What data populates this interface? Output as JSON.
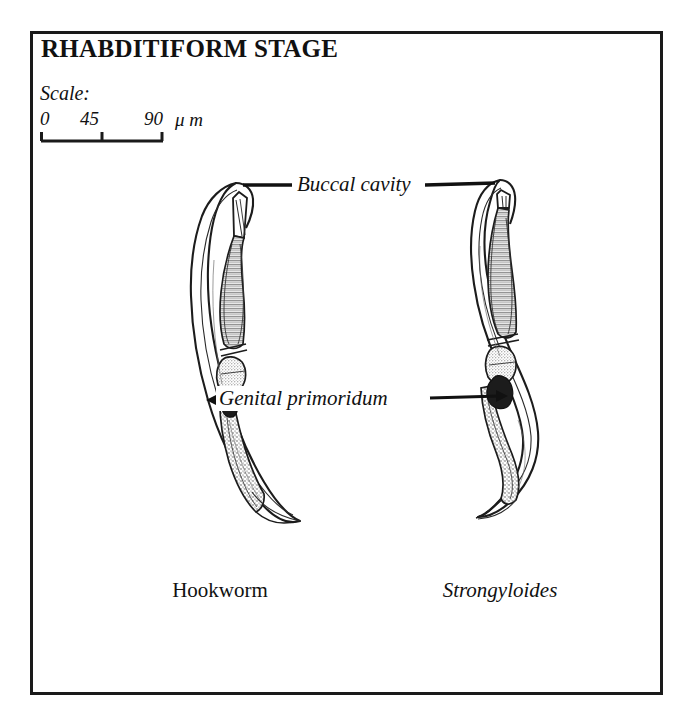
{
  "plate": {
    "title": "RHABDITIFORM STAGE",
    "border_color": "#1a1a1a",
    "background_color": "#ffffff",
    "ink_color": "#111111"
  },
  "scale": {
    "caption": "Scale:",
    "ticks": [
      "0",
      "45",
      "90"
    ],
    "unit": "μ m",
    "tick_values": [
      0,
      45,
      90
    ],
    "bar_length_px": 122
  },
  "annotations": [
    {
      "id": "buccal-cavity",
      "text": "Buccal cavity",
      "style": "italic"
    },
    {
      "id": "genital-primordium",
      "text": "Genital primoridum",
      "style": "italic"
    }
  ],
  "specimens": [
    {
      "id": "hookworm",
      "caption": "Hookworm",
      "caption_style": "roman"
    },
    {
      "id": "strongyloides",
      "caption": "Strongyloides",
      "caption_style": "italic"
    }
  ]
}
